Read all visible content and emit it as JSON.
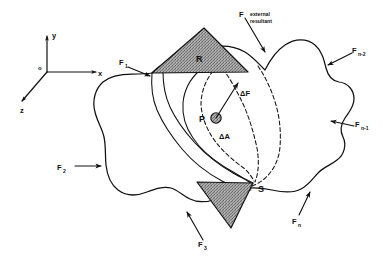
{
  "figure": {
    "axes": {
      "origin_label": "o",
      "x_label": "x",
      "y_label": "y",
      "z_label": "z"
    },
    "regions": {
      "upper_section_label": "R",
      "lower_section_label": "S",
      "point_label": "P"
    },
    "increments": {
      "force_increment_label": "ΔF",
      "area_increment_label": "ΔA"
    },
    "resultant": {
      "symbol": "F",
      "caption_line1": "external",
      "caption_line2": "resultant"
    },
    "external_forces": [
      {
        "name": "force-1",
        "label": "F",
        "subscript": "1"
      },
      {
        "name": "force-2",
        "label": "F",
        "subscript": "2"
      },
      {
        "name": "force-3",
        "label": "F",
        "subscript": "3"
      },
      {
        "name": "force-n",
        "label": "F",
        "subscript": "n"
      },
      {
        "name": "force-n-minus-1",
        "label": "F",
        "subscript": "n-1"
      },
      {
        "name": "force-n-minus-2",
        "label": "F",
        "subscript": "n-2"
      }
    ],
    "colors": {
      "ink": "#111111",
      "paper": "#ffffff",
      "shading": "#9a9a9a",
      "point_fill": "#8e8e8e"
    }
  }
}
